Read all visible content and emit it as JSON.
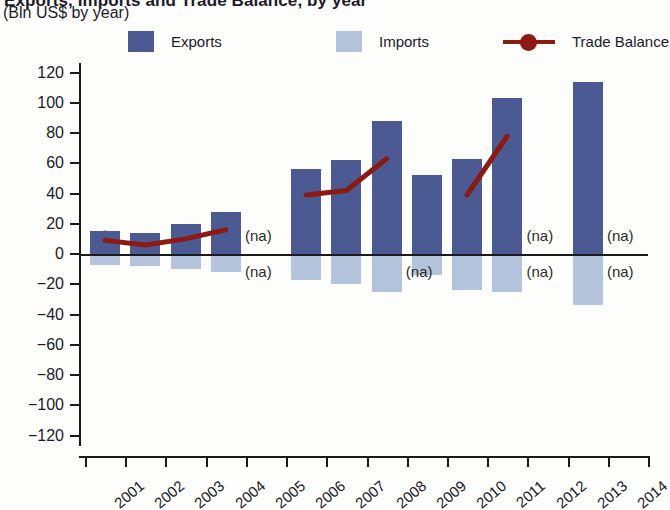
{
  "header": {
    "title_clipped": "Exports, Imports and Trade Balance, by year",
    "subtitle": "(Bln US$ by year)"
  },
  "legend": {
    "items": [
      {
        "label": "Exports",
        "type": "swatch",
        "color": "#4c5a93"
      },
      {
        "label": "Imports",
        "type": "swatch",
        "color": "#b4c4dc"
      },
      {
        "label": "Trade Balance",
        "type": "line-marker",
        "color": "#8d1a12"
      }
    ]
  },
  "colors": {
    "exports": "#4c5a93",
    "imports": "#b4c4dc",
    "trade_balance": "#8d1a12",
    "axis": "#1a1a1a",
    "background": "#fdfdfb"
  },
  "axis": {
    "y_ticks": [
      "120",
      "100",
      "80",
      "60",
      "40",
      "20",
      "0",
      "-20",
      "-40",
      "-60",
      "-80",
      "-100",
      "-120"
    ],
    "x_ticks": [
      "2001",
      "2002",
      "2003",
      "2004",
      "2005",
      "2006",
      "2007",
      "2008",
      "2009",
      "2010",
      "2011",
      "2012",
      "2013",
      "2014"
    ],
    "na_label": "(na)"
  },
  "chart_data": {
    "type": "bar",
    "title": "Exports, Imports and Trade Balance, by year",
    "subtitle": "(Bln US$ by year)",
    "xlabel": "",
    "ylabel": "Bln US$",
    "ylim": [
      -120,
      120
    ],
    "ytick_step": 20,
    "grid": false,
    "legend_position": "top",
    "categories": [
      "2001",
      "2002",
      "2003",
      "2004",
      "2005",
      "2006",
      "2007",
      "2008",
      "2009",
      "2010",
      "2011",
      "2012",
      "2013",
      "2014"
    ],
    "series": [
      {
        "name": "Exports",
        "kind": "bar",
        "color": "#4c5a93",
        "values": [
          15,
          14,
          20,
          28,
          null,
          56,
          62,
          88,
          52,
          63,
          103,
          null,
          114,
          null
        ]
      },
      {
        "name": "Imports",
        "kind": "bar",
        "color": "#b4c4dc",
        "note": "plotted as negative values below the zero line",
        "values": [
          -7,
          -8,
          -10,
          -12,
          null,
          -17,
          -20,
          -25,
          -14,
          -24,
          -25,
          null,
          -34,
          null
        ]
      },
      {
        "name": "Trade Balance",
        "kind": "line",
        "color": "#8d1a12",
        "values": [
          9,
          6,
          10,
          16,
          null,
          39,
          42,
          63,
          null,
          39,
          78,
          null,
          85,
          null
        ]
      }
    ],
    "na_markers": [
      {
        "category": "2005",
        "position": "above"
      },
      {
        "category": "2005",
        "position": "below"
      },
      {
        "category": "2009",
        "position": "below"
      },
      {
        "category": "2012",
        "position": "above"
      },
      {
        "category": "2012",
        "position": "below"
      },
      {
        "category": "2014",
        "position": "above"
      },
      {
        "category": "2014",
        "position": "below"
      }
    ]
  }
}
